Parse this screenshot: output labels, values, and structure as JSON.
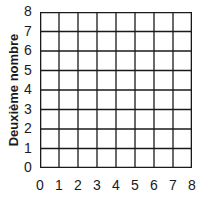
{
  "chart_data": {
    "type": "scatter",
    "title": "",
    "xlabel": "",
    "ylabel": "Deuxième nombre",
    "xlim": [
      0,
      8
    ],
    "ylim": [
      0,
      8
    ],
    "x_ticks": [
      "0",
      "1",
      "2",
      "3",
      "4",
      "5",
      "6",
      "7",
      "8"
    ],
    "y_ticks": [
      "0",
      "1",
      "2",
      "3",
      "4",
      "5",
      "6",
      "7",
      "8"
    ],
    "grid": true,
    "series": [],
    "legend": null
  },
  "colors": {
    "grid_line": "#1a1a1a",
    "background": "#ffffff"
  }
}
